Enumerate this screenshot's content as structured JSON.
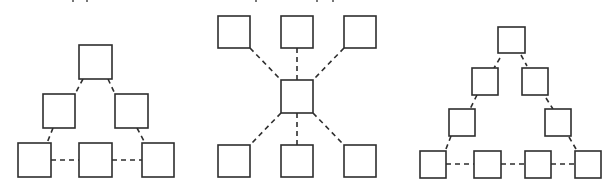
{
  "colors": {
    "stroke": "#2e2e2e",
    "background": "#ffffff"
  },
  "diagrams": [
    {
      "name": "triangle-topology-6",
      "nodes": [
        {
          "id": "a",
          "x": 79,
          "y": 45,
          "w": 33,
          "h": 34
        },
        {
          "id": "b",
          "x": 43,
          "y": 94,
          "w": 32,
          "h": 34
        },
        {
          "id": "c",
          "x": 115,
          "y": 94,
          "w": 33,
          "h": 34
        },
        {
          "id": "d",
          "x": 18,
          "y": 143,
          "w": 33,
          "h": 34
        },
        {
          "id": "e",
          "x": 79,
          "y": 143,
          "w": 33,
          "h": 34
        },
        {
          "id": "f",
          "x": 142,
          "y": 143,
          "w": 32,
          "h": 34
        }
      ],
      "edges": [
        {
          "x1": 83,
          "y1": 79,
          "x2": 75,
          "y2": 94
        },
        {
          "x1": 108,
          "y1": 79,
          "x2": 115,
          "y2": 94
        },
        {
          "x1": 53,
          "y1": 128,
          "x2": 47,
          "y2": 143
        },
        {
          "x1": 137,
          "y1": 128,
          "x2": 145,
          "y2": 143
        },
        {
          "x1": 51,
          "y1": 160,
          "x2": 79,
          "y2": 160
        },
        {
          "x1": 112,
          "y1": 160,
          "x2": 142,
          "y2": 160
        }
      ]
    },
    {
      "name": "star-topology",
      "nodes": [
        {
          "id": "t1",
          "x": 218,
          "y": 16,
          "w": 32,
          "h": 32
        },
        {
          "id": "t2",
          "x": 281,
          "y": 16,
          "w": 32,
          "h": 32
        },
        {
          "id": "t3",
          "x": 344,
          "y": 16,
          "w": 32,
          "h": 32
        },
        {
          "id": "hub",
          "x": 281,
          "y": 80,
          "w": 32,
          "h": 33
        },
        {
          "id": "b1",
          "x": 218,
          "y": 145,
          "w": 32,
          "h": 32
        },
        {
          "id": "b2",
          "x": 281,
          "y": 145,
          "w": 32,
          "h": 32
        },
        {
          "id": "b3",
          "x": 344,
          "y": 145,
          "w": 32,
          "h": 32
        }
      ],
      "edges": [
        {
          "x1": 250,
          "y1": 48,
          "x2": 281,
          "y2": 80
        },
        {
          "x1": 297,
          "y1": 48,
          "x2": 297,
          "y2": 80
        },
        {
          "x1": 344,
          "y1": 48,
          "x2": 313,
          "y2": 80
        },
        {
          "x1": 281,
          "y1": 113,
          "x2": 250,
          "y2": 145
        },
        {
          "x1": 297,
          "y1": 113,
          "x2": 297,
          "y2": 145
        },
        {
          "x1": 313,
          "y1": 113,
          "x2": 344,
          "y2": 145
        }
      ]
    },
    {
      "name": "triangle-topology-10",
      "nodes": [
        {
          "id": "a",
          "x": 498,
          "y": 27,
          "w": 27,
          "h": 26
        },
        {
          "id": "b",
          "x": 472,
          "y": 68,
          "w": 26,
          "h": 27
        },
        {
          "id": "c",
          "x": 522,
          "y": 68,
          "w": 26,
          "h": 27
        },
        {
          "id": "d",
          "x": 449,
          "y": 109,
          "w": 26,
          "h": 27
        },
        {
          "id": "e",
          "x": 545,
          "y": 109,
          "w": 26,
          "h": 27
        },
        {
          "id": "f",
          "x": 420,
          "y": 151,
          "w": 26,
          "h": 27
        },
        {
          "id": "g",
          "x": 474,
          "y": 151,
          "w": 27,
          "h": 27
        },
        {
          "id": "h",
          "x": 525,
          "y": 151,
          "w": 26,
          "h": 27
        },
        {
          "id": "i",
          "x": 575,
          "y": 151,
          "w": 26,
          "h": 27
        }
      ],
      "edges": [
        {
          "x1": 500,
          "y1": 58,
          "x2": 494,
          "y2": 68
        },
        {
          "x1": 521,
          "y1": 55,
          "x2": 527,
          "y2": 66
        },
        {
          "x1": 477,
          "y1": 95,
          "x2": 470,
          "y2": 109
        },
        {
          "x1": 546,
          "y1": 98,
          "x2": 553,
          "y2": 109
        },
        {
          "x1": 451,
          "y1": 136,
          "x2": 446,
          "y2": 149
        },
        {
          "x1": 569,
          "y1": 137,
          "x2": 576,
          "y2": 149
        },
        {
          "x1": 446,
          "y1": 164,
          "x2": 474,
          "y2": 164
        },
        {
          "x1": 501,
          "y1": 164,
          "x2": 525,
          "y2": 164
        },
        {
          "x1": 551,
          "y1": 164,
          "x2": 575,
          "y2": 164
        }
      ]
    }
  ]
}
